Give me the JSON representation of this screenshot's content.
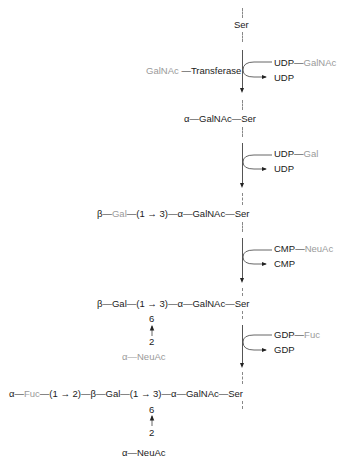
{
  "diagram": {
    "colors": {
      "primary_text": "#1a1a1a",
      "secondary_text": "#9a9a9a",
      "line": "#555555"
    },
    "start": {
      "label": "Ser"
    },
    "enzyme": {
      "substrate": "GalNAc",
      "dash": "—",
      "name": "Transferase"
    },
    "steps": [
      {
        "donor_nucleotide": "UDP",
        "donor_sugar": "GalNAc",
        "released": "UDP"
      },
      {
        "donor_nucleotide": "UDP",
        "donor_sugar": "Gal",
        "released": "UDP"
      },
      {
        "donor_nucleotide": "CMP",
        "donor_sugar": "NeuAc",
        "released": "CMP"
      },
      {
        "donor_nucleotide": "GDP",
        "donor_sugar": "Fuc",
        "released": "GDP"
      }
    ],
    "products": [
      {
        "anomer": "α",
        "sugar": "GalNAc",
        "residue": "Ser"
      },
      {
        "beta": "β",
        "gal": "Gal",
        "link": "(1 → 3)",
        "alpha": "α",
        "galnac": "GalNAc",
        "residue": "Ser"
      },
      {
        "beta": "β",
        "gal": "Gal",
        "link": "(1 → 3)",
        "alpha": "α",
        "galnac": "GalNAc",
        "residue": "Ser",
        "branch": {
          "pos_top": "6",
          "pos_bottom": "2",
          "anomer": "α",
          "sugar": "NeuAc"
        }
      },
      {
        "fuc_anomer": "α",
        "fuc": "Fuc",
        "link1": "(1 → 2)",
        "beta": "β",
        "gal": "Gal",
        "link2": "(1 → 3)",
        "alpha": "α",
        "galnac": "GalNAc",
        "residue": "Ser",
        "branch": {
          "pos_top": "6",
          "pos_bottom": "2",
          "anomer": "α",
          "sugar": "NeuAc"
        }
      }
    ],
    "dash": "—"
  }
}
